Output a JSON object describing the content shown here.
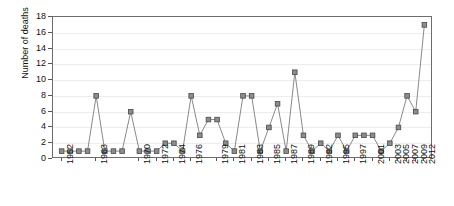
{
  "chart_data": {
    "type": "line",
    "title": "",
    "xlabel": "",
    "ylabel": "Number of deaths",
    "ylim": [
      0,
      18
    ],
    "ytick_step": 2,
    "yticks": [
      0,
      2,
      4,
      6,
      8,
      10,
      12,
      14,
      16,
      18
    ],
    "grid": true,
    "legend": "none",
    "marker": "square",
    "marker_color": "#8c8c8c",
    "marker_edge_color": "#4a4a4a",
    "line_color": "#6b6b6b",
    "categories": [
      "1952",
      "1960",
      "1961",
      "1962",
      "1963",
      "1964",
      "1966",
      "1967",
      "1968",
      "1970",
      "1971",
      "1972",
      "1973",
      "1974",
      "1975",
      "1976",
      "1977",
      "1978",
      "1979",
      "1980",
      "1981",
      "1982",
      "1983",
      "1984",
      "1985",
      "1986",
      "1987",
      "1988",
      "1989",
      "1990",
      "1991",
      "1992",
      "1993",
      "1994",
      "1995",
      "1996",
      "1997",
      "1998",
      "1999",
      "2000",
      "2001",
      "2002",
      "2003"
    ],
    "values": [
      1,
      1,
      1,
      1,
      8,
      1,
      1,
      1,
      6,
      1,
      1,
      1,
      2,
      2,
      1,
      8,
      3,
      5,
      5,
      2,
      1,
      8,
      8,
      1,
      4,
      7,
      1,
      11,
      3,
      1,
      2,
      1,
      3,
      1,
      3,
      3,
      3,
      1,
      2,
      4,
      8,
      6,
      17
    ],
    "xtick_labels": [
      "1952",
      "1963",
      "1970",
      "1972",
      "1974",
      "1976",
      "1979",
      "1981",
      "1983",
      "1985",
      "1987",
      "1989",
      "1992",
      "1995",
      "1997",
      "2001",
      "2003",
      "2005",
      "2007",
      "2009",
      "2012"
    ],
    "xtick_indices": [
      0,
      4,
      9,
      11,
      13,
      15,
      18,
      20,
      22,
      24,
      26,
      28,
      30,
      32,
      34,
      36,
      38,
      39,
      40,
      41,
      42
    ]
  }
}
